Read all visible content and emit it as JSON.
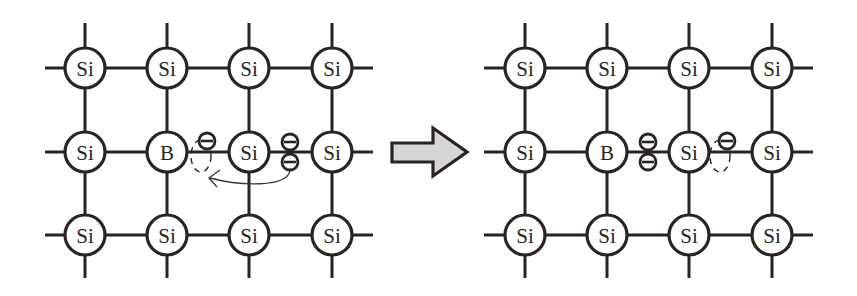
{
  "diagram": {
    "title": "",
    "colors": {
      "line": "#2a2320",
      "arrow_fill": "#d6d6d6",
      "background": "#ffffff"
    },
    "left_panel": {
      "name": "before",
      "lattice": [
        [
          "Si",
          "Si",
          "Si",
          "Si"
        ],
        [
          "Si",
          "B",
          "Si",
          "Si"
        ],
        [
          "Si",
          "Si",
          "Si",
          "Si"
        ]
      ],
      "annotations": {
        "hole_near": "B",
        "electron_pair_between": [
          "Si (row 2, col 3)",
          "Si (row 2, col 4)"
        ],
        "electron_moving_to": "hole beside B",
        "electron_symbol": "⊖"
      }
    },
    "transition_arrow": {
      "direction": "right"
    },
    "right_panel": {
      "name": "after",
      "lattice": [
        [
          "Si",
          "Si",
          "Si",
          "Si"
        ],
        [
          "Si",
          "B",
          "Si",
          "Si"
        ],
        [
          "Si",
          "Si",
          "Si",
          "Si"
        ]
      ],
      "annotations": {
        "electron_pair_between": [
          "B",
          "Si (row 2, col 3)"
        ],
        "hole_near": "Si (row 2, col 3)",
        "electron_symbol": "⊖"
      }
    },
    "labels": {
      "L": {
        "r0": [
          "Si",
          "Si",
          "Si",
          "Si"
        ],
        "r1": [
          "Si",
          "B",
          "Si",
          "Si"
        ],
        "r2": [
          "Si",
          "Si",
          "Si",
          "Si"
        ]
      },
      "R": {
        "r0": [
          "Si",
          "Si",
          "Si",
          "Si"
        ],
        "r1": [
          "Si",
          "B",
          "Si",
          "Si"
        ],
        "r2": [
          "Si",
          "Si",
          "Si",
          "Si"
        ]
      }
    }
  }
}
